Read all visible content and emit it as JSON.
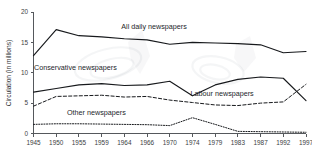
{
  "chart_data": {
    "type": "line",
    "title": "",
    "subtitle": "",
    "xlabel": "",
    "ylabel": "Circulation (in millions)",
    "xlim": [
      1945,
      1997
    ],
    "ylim": [
      0,
      20
    ],
    "grid": false,
    "legend_position": "inline-annotations",
    "x_tick_labels": [
      "1945",
      "1950",
      "1955",
      "1959",
      "1964",
      "1966",
      "1970",
      "1974",
      "1979",
      "1983",
      "1987",
      "1992",
      "1997"
    ],
    "x_ticks": [
      1945,
      1950,
      1955,
      1959,
      1964,
      1966,
      1970,
      1974,
      1979,
      1983,
      1987,
      1992,
      1997
    ],
    "y_tick_labels": [
      "0",
      "5",
      "10",
      "15",
      "20"
    ],
    "y_ticks": [
      0,
      5,
      10,
      15,
      20
    ],
    "x": [
      1945,
      1950,
      1955,
      1959,
      1964,
      1966,
      1970,
      1974,
      1979,
      1983,
      1987,
      1992,
      1997
    ],
    "series": [
      {
        "name": "All daily newspapers",
        "style": "solid",
        "label": "All daily newspapers",
        "values": [
          12.8,
          17.1,
          16.1,
          15.9,
          15.6,
          15.4,
          14.7,
          15.0,
          14.9,
          14.8,
          14.6,
          13.3,
          13.5
        ]
      },
      {
        "name": "Conservative newspapers",
        "style": "solid",
        "label": "Conservative newspapers",
        "values": [
          6.8,
          7.4,
          8.0,
          8.2,
          7.9,
          8.0,
          8.6,
          6.2,
          8.0,
          8.9,
          9.3,
          9.1,
          5.4
        ]
      },
      {
        "name": "Labour newspapers",
        "style": "dashed",
        "label": "Labour newspapers",
        "values": [
          4.5,
          6.1,
          6.2,
          6.3,
          6.0,
          6.1,
          5.5,
          5.1,
          4.7,
          4.6,
          5.0,
          5.2,
          8.1
        ]
      },
      {
        "name": "Other newspapers",
        "style": "dotted",
        "label": "Other newspapers",
        "values": [
          1.5,
          1.6,
          1.6,
          1.55,
          1.5,
          1.45,
          1.3,
          2.6,
          1.5,
          0.35,
          0.3,
          0.25,
          0.2
        ]
      }
    ],
    "annotations": [
      {
        "text": "All daily newspapers",
        "x": 1968,
        "y": 17.2
      },
      {
        "text": "Conservative newspapers",
        "x": 1953,
        "y": 10.4
      },
      {
        "text": "Labour newspapers",
        "x": 1981,
        "y": 6.1
      },
      {
        "text": "Other newspapers",
        "x": 1957,
        "y": 3.0
      }
    ],
    "colors": {
      "line": "#17191c",
      "axis": "#55585c",
      "text": "#24262a",
      "background": "#ffffff"
    }
  }
}
